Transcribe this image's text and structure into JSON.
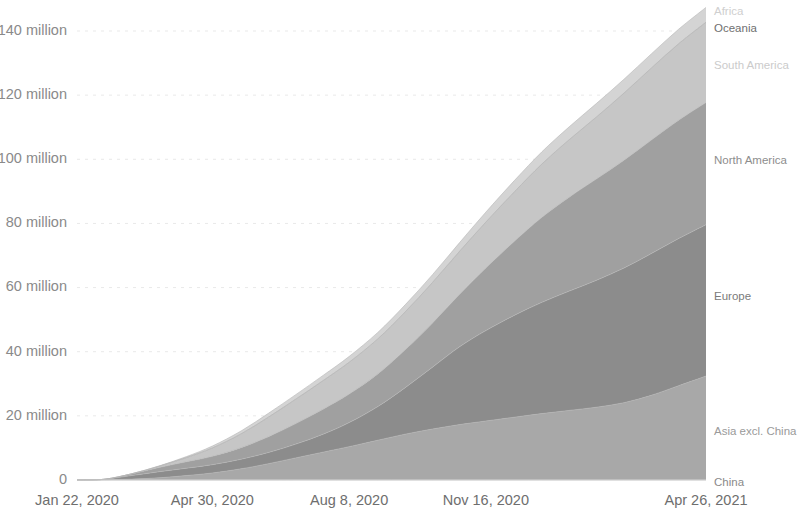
{
  "chart_data": {
    "type": "area",
    "stacked": true,
    "title": "",
    "subtitle": "",
    "xlabel": "",
    "ylabel": "",
    "grid": true,
    "legend_position": "right-inline",
    "ylim": [
      0,
      147
    ],
    "y_unit": "million",
    "y_ticks": [
      0,
      20,
      40,
      60,
      80,
      100,
      120,
      140
    ],
    "y_tick_labels": [
      "0",
      "20 million",
      "40 million",
      "60 million",
      "80 million",
      "100 million",
      "120 million",
      "140 million"
    ],
    "x_tick_labels": [
      "Jan 22, 2020",
      "Apr 30, 2020",
      "Aug 8, 2020",
      "Nov 16, 2020",
      "Apr 26, 2021"
    ],
    "x_tick_positions": [
      0,
      99,
      199,
      299,
      460
    ],
    "x_start": "Jan 22, 2020",
    "x_end": "Apr 26, 2021",
    "x_total_days": 460,
    "x": [
      0,
      20,
      40,
      60,
      80,
      99,
      120,
      140,
      160,
      180,
      199,
      220,
      240,
      260,
      280,
      299,
      320,
      340,
      360,
      380,
      400,
      420,
      440,
      460
    ],
    "series": [
      {
        "name": "China",
        "color": "#9b9b9b",
        "values": [
          0.01,
          0.06,
          0.08,
          0.08,
          0.08,
          0.08,
          0.08,
          0.08,
          0.09,
          0.09,
          0.09,
          0.09,
          0.09,
          0.09,
          0.09,
          0.09,
          0.09,
          0.1,
          0.1,
          0.1,
          0.1,
          0.1,
          0.1,
          0.1
        ]
      },
      {
        "name": "Asia excl. China",
        "color": "#a8a8a8",
        "values": [
          0.0,
          0.05,
          0.2,
          0.6,
          1.3,
          2.1,
          3.4,
          5.0,
          6.8,
          8.6,
          10.3,
          12.3,
          14.2,
          15.8,
          17.2,
          18.3,
          19.5,
          20.6,
          21.6,
          22.6,
          24.0,
          26.3,
          29.3,
          32.3
        ]
      },
      {
        "name": "Europe",
        "color": "#8c8c8c",
        "values": [
          0.0,
          0.1,
          1.1,
          1.9,
          2.3,
          2.6,
          3.0,
          3.5,
          4.3,
          5.6,
          7.5,
          10.5,
          14.5,
          19.3,
          24.3,
          28.2,
          31.8,
          34.7,
          37.2,
          39.6,
          42.0,
          44.2,
          45.9,
          47.2
        ]
      },
      {
        "name": "North America",
        "color": "#a0a0a0",
        "values": [
          0.0,
          0.02,
          0.5,
          1.3,
          2.0,
          2.6,
          3.6,
          4.9,
          6.4,
          7.8,
          8.9,
          10.2,
          11.8,
          13.8,
          16.4,
          19.5,
          23.1,
          26.5,
          29.3,
          31.6,
          33.6,
          35.4,
          36.9,
          38.1
        ]
      },
      {
        "name": "South America",
        "color": "#c6c6c6",
        "values": [
          0.0,
          0.0,
          0.05,
          0.4,
          1.3,
          2.6,
          4.3,
          6.1,
          7.6,
          8.9,
          9.9,
          10.9,
          11.8,
          12.6,
          13.4,
          14.3,
          15.4,
          16.6,
          17.9,
          19.3,
          20.9,
          22.4,
          23.8,
          25.0
        ]
      },
      {
        "name": "Oceania",
        "color": "#bdbdbd",
        "values": [
          0.0,
          0.0,
          0.007,
          0.008,
          0.009,
          0.01,
          0.012,
          0.016,
          0.023,
          0.027,
          0.029,
          0.03,
          0.031,
          0.032,
          0.033,
          0.034,
          0.036,
          0.04,
          0.045,
          0.05,
          0.053,
          0.055,
          0.057,
          0.06
        ]
      },
      {
        "name": "Africa",
        "color": "#d4d4d4",
        "values": [
          0.0,
          0.0,
          0.02,
          0.1,
          0.3,
          0.6,
          0.9,
          1.2,
          1.4,
          1.6,
          1.8,
          2.0,
          2.2,
          2.4,
          2.7,
          3.1,
          3.5,
          3.8,
          4.0,
          4.2,
          4.3,
          4.4,
          4.5,
          4.6
        ]
      }
    ],
    "series_label_positions": [
      {
        "name": "Africa",
        "y_px": 12
      },
      {
        "name": "Oceania",
        "y_px": 29
      },
      {
        "name": "South America",
        "y_px": 66
      },
      {
        "name": "North America",
        "y_px": 161
      },
      {
        "name": "Europe",
        "y_px": 297
      },
      {
        "name": "Asia excl. China",
        "y_px": 432
      },
      {
        "name": "China",
        "y_px": 483
      }
    ],
    "series_label_colors": [
      "#cfcfcf",
      "#6f6f6f",
      "#cbcbcb",
      "#8d8d8d",
      "#7a7a7a",
      "#9a9a9a",
      "#8a8a8a"
    ]
  }
}
